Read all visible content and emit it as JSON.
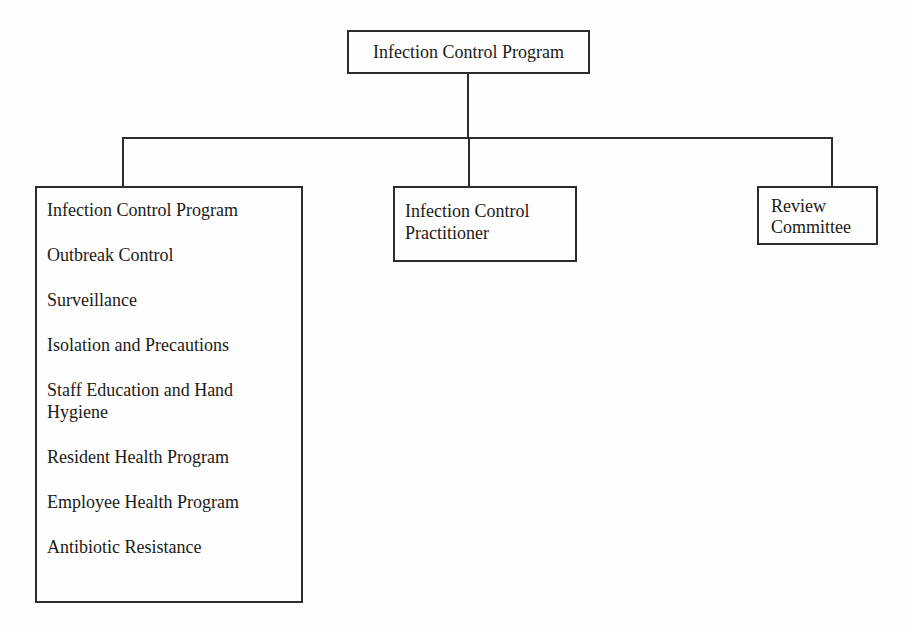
{
  "colors": {
    "line": "#2e2c29",
    "box-border": "#2e2c29",
    "text": "#1c1a17",
    "paper": "#fefefe"
  },
  "org_chart": {
    "type": "org-tree",
    "root": {
      "label": "Infection Control Program"
    },
    "branches": [
      {
        "name": "program-functions",
        "items": [
          "Infection Control Program",
          "Outbreak Control",
          "Surveillance",
          "Isolation and Precautions",
          "Staff Education and Hand Hygiene",
          "Resident Health Program",
          "Employee Health Program",
          "Antibiotic Resistance"
        ]
      },
      {
        "name": "practitioner",
        "label": "Infection Control Practitioner"
      },
      {
        "name": "review-committee",
        "label": "Review Committee"
      }
    ]
  }
}
